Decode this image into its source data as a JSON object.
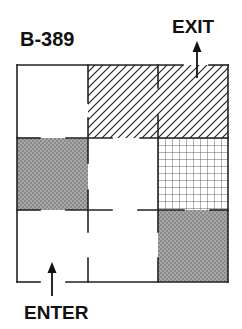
{
  "diagram": {
    "title": "B-389",
    "exit_label": "EXIT",
    "enter_label": "ENTER",
    "grid": {
      "rows": 3,
      "cols": 3
    },
    "colors": {
      "wall": "#222222",
      "crosshatch_fill": "#9a9a9a",
      "diagonal_hatch": "#222222",
      "grid_pattern": "#444444",
      "background": "#ffffff"
    },
    "cells": [
      {
        "row": 1,
        "col": 1,
        "fill": "none"
      },
      {
        "row": 1,
        "col": 2,
        "fill": "diagonal-hatch"
      },
      {
        "row": 1,
        "col": 3,
        "fill": "diagonal-hatch"
      },
      {
        "row": 2,
        "col": 1,
        "fill": "gray-crosshatch"
      },
      {
        "row": 2,
        "col": 2,
        "fill": "none"
      },
      {
        "row": 2,
        "col": 3,
        "fill": "square-grid"
      },
      {
        "row": 3,
        "col": 1,
        "fill": "none"
      },
      {
        "row": 3,
        "col": 2,
        "fill": "none"
      },
      {
        "row": 3,
        "col": 3,
        "fill": "gray-crosshatch"
      }
    ],
    "entrance": {
      "row": 3,
      "col": 1,
      "side": "bottom"
    },
    "exit": {
      "row": 1,
      "col": 3,
      "side": "top"
    }
  }
}
